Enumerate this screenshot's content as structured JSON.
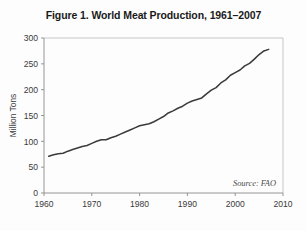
{
  "figure": {
    "title": "Figure 1. World Meat Production, 1961–2007",
    "source_note": "Source: FAO"
  },
  "chart_data": {
    "type": "line",
    "title": "Figure 1. World Meat Production, 1961–2007",
    "xlabel": "",
    "ylabel": "Million Tons",
    "xlim": [
      1960,
      2010
    ],
    "ylim": [
      0,
      300
    ],
    "xticks": [
      1960,
      1970,
      1980,
      1990,
      2000,
      2010
    ],
    "yticks": [
      0,
      50,
      100,
      150,
      200,
      250,
      300
    ],
    "xtick_labels": [
      "1960",
      "1970",
      "1980",
      "1990",
      "2000",
      "2010"
    ],
    "ytick_labels": [
      "0",
      "50",
      "100",
      "150",
      "200",
      "250",
      "300"
    ],
    "grid": false,
    "legend": null,
    "annotations": [
      {
        "text": "Source: FAO",
        "position": "bottom-right",
        "style": "italic"
      }
    ],
    "series": [
      {
        "name": "World Meat Production",
        "color": "#3b3b3b",
        "units": "million tons",
        "x": [
          1961,
          1962,
          1963,
          1964,
          1965,
          1966,
          1967,
          1968,
          1969,
          1970,
          1971,
          1972,
          1973,
          1974,
          1975,
          1976,
          1977,
          1978,
          1979,
          1980,
          1981,
          1982,
          1983,
          1984,
          1985,
          1986,
          1987,
          1988,
          1989,
          1990,
          1991,
          1992,
          1993,
          1994,
          1995,
          1996,
          1997,
          1998,
          1999,
          2000,
          2001,
          2002,
          2003,
          2004,
          2005,
          2006,
          2007
        ],
        "values": [
          71,
          74,
          76,
          77,
          81,
          84,
          87,
          90,
          92,
          96,
          100,
          103,
          103,
          107,
          110,
          114,
          118,
          122,
          126,
          130,
          132,
          134,
          138,
          143,
          148,
          155,
          159,
          164,
          168,
          174,
          178,
          181,
          184,
          192,
          199,
          204,
          213,
          219,
          228,
          233,
          238,
          246,
          251,
          259,
          268,
          275,
          278
        ]
      }
    ]
  },
  "axes": {
    "y_axis_title": "Million Tons",
    "x_tick_labels": [
      "1960",
      "1970",
      "1980",
      "1990",
      "2000",
      "2010"
    ],
    "y_tick_labels": [
      "300",
      "250",
      "200",
      "150",
      "100",
      "50",
      "0"
    ]
  }
}
